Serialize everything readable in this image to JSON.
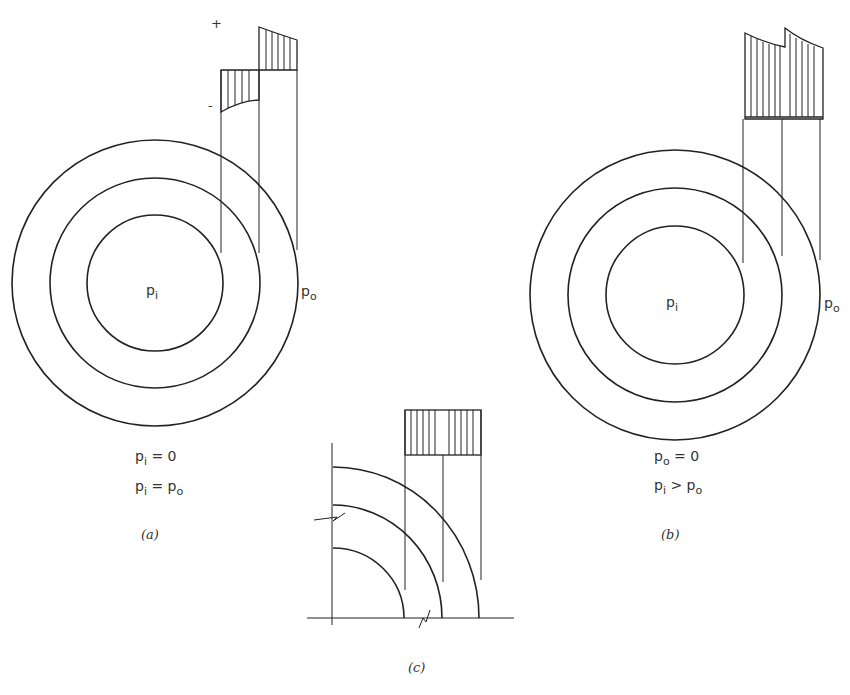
{
  "figure_a": {
    "caption": "(a)",
    "center_label": {
      "sym": "p",
      "sub": "i"
    },
    "outer_label": {
      "sym": "p",
      "sub": "o"
    },
    "condition_1": {
      "lhs_sym": "p",
      "lhs_sub": "i",
      "op": "=",
      "rhs": "0"
    },
    "condition_2": {
      "lhs_sym": "p",
      "lhs_sub": "i",
      "op": "=",
      "rhs_sym": "p",
      "rhs_sub": "o"
    },
    "plus_sign": "+",
    "minus_sign": "-"
  },
  "figure_b": {
    "caption": "(b)",
    "center_label": {
      "sym": "p",
      "sub": "i"
    },
    "outer_label": {
      "sym": "p",
      "sub": "o"
    },
    "condition_1": {
      "lhs_sym": "p",
      "lhs_sub": "o",
      "op": "=",
      "rhs": "0"
    },
    "condition_2": {
      "lhs_sym": "p",
      "lhs_sub": "i",
      "op": ">",
      "rhs_sym": "p",
      "rhs_sub": "o"
    }
  },
  "figure_c": {
    "caption": "(c)"
  },
  "colors": {
    "line": "#222222",
    "text": "#333333",
    "background": "#ffffff"
  }
}
